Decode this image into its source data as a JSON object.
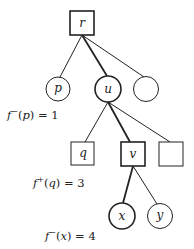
{
  "diagram": {
    "type": "tree",
    "nodes": [
      {
        "id": "r",
        "label": "r",
        "shape": "square",
        "emphasis": true
      },
      {
        "id": "p",
        "label": "p",
        "shape": "circle",
        "emphasis": false
      },
      {
        "id": "u",
        "label": "u",
        "shape": "circle",
        "emphasis": true
      },
      {
        "id": "c3",
        "label": "",
        "shape": "circle",
        "emphasis": false
      },
      {
        "id": "q",
        "label": "q",
        "shape": "square",
        "emphasis": false
      },
      {
        "id": "v",
        "label": "v",
        "shape": "square",
        "emphasis": true
      },
      {
        "id": "s3",
        "label": "",
        "shape": "square",
        "emphasis": false
      },
      {
        "id": "x",
        "label": "x",
        "shape": "circle",
        "emphasis": true
      },
      {
        "id": "y",
        "label": "y",
        "shape": "circle",
        "emphasis": false
      }
    ],
    "edges": [
      {
        "from": "r",
        "to": "p",
        "bold": false
      },
      {
        "from": "r",
        "to": "u",
        "bold": true
      },
      {
        "from": "r",
        "to": "c3",
        "bold": false
      },
      {
        "from": "u",
        "to": "q",
        "bold": false
      },
      {
        "from": "u",
        "to": "v",
        "bold": true
      },
      {
        "from": "u",
        "to": "s3",
        "bold": false
      },
      {
        "from": "v",
        "to": "x",
        "bold": true
      },
      {
        "from": "v",
        "to": "y",
        "bold": false
      }
    ],
    "annotations": [
      {
        "fn": "f",
        "sup": "−",
        "arg": "p",
        "value": "1"
      },
      {
        "fn": "f",
        "sup": "+",
        "arg": "q",
        "value": "3"
      },
      {
        "fn": "f",
        "sup": "−",
        "arg": "x",
        "value": "4"
      }
    ]
  }
}
